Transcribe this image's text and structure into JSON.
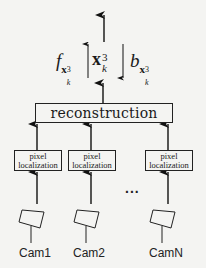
{
  "diagram": {
    "output_labels": {
      "forward": {
        "base": "f",
        "subscript": "x",
        "sub_sup": "3",
        "sub_sub": "k"
      },
      "state": {
        "base": "x",
        "sup": "3",
        "sub": "k"
      },
      "backward": {
        "base": "b",
        "subscript": "x",
        "sub_sup": "3",
        "sub_sub": "k"
      }
    },
    "reconstruction_label": "reconstruction",
    "pixel_localization": [
      {
        "line1": "pixel",
        "line2": "localization"
      },
      {
        "line1": "pixel",
        "line2": "localization"
      },
      {
        "line1": "pixel",
        "line2": "localization"
      }
    ],
    "ellipsis": "...",
    "cameras": [
      {
        "label": "Cam1"
      },
      {
        "label": "Cam2"
      },
      {
        "label": "CamN"
      }
    ],
    "colors": {
      "line": "#222222",
      "background": "#f4f4f2"
    }
  }
}
